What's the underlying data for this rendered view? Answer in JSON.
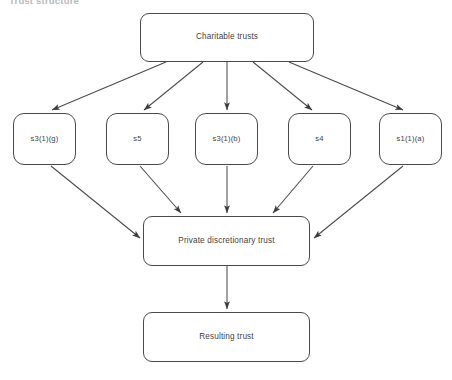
{
  "heading": {
    "text": "Trust structure"
  },
  "diagram": {
    "type": "flowchart",
    "width": 452,
    "height": 380,
    "stroke_color": "#4a4a4a",
    "text_color": "#3f3f3f",
    "background_color": "#ffffff",
    "nodes": [
      {
        "id": "charitable-trusts",
        "label": "Charitable trusts",
        "row": "top",
        "x": 140,
        "y": 13,
        "width": 174,
        "height": 49
      },
      {
        "id": "s3-1-g",
        "label": "s3(1)(g)",
        "row": "middle",
        "x": 13,
        "y": 113,
        "width": 63,
        "height": 52
      },
      {
        "id": "s5",
        "label": "s5",
        "row": "middle",
        "x": 106,
        "y": 113,
        "width": 63,
        "height": 52
      },
      {
        "id": "s3-1-b",
        "label": "s3(1)(b)",
        "row": "middle",
        "x": 195,
        "y": 113,
        "width": 63,
        "height": 52
      },
      {
        "id": "s4",
        "label": "s4",
        "row": "middle",
        "x": 288,
        "y": 113,
        "width": 63,
        "height": 52
      },
      {
        "id": "s1-1-a",
        "label": "s1(1)(a)",
        "row": "middle",
        "x": 379,
        "y": 113,
        "width": 63,
        "height": 52
      },
      {
        "id": "private-discretionary-trust",
        "label": "Private discretionary trust",
        "row": "lower",
        "x": 143,
        "y": 216,
        "width": 167,
        "height": 50
      },
      {
        "id": "resulting-trust",
        "label": "Resulting trust",
        "row": "bottom",
        "x": 143,
        "y": 312,
        "width": 167,
        "height": 50
      }
    ],
    "edges": [
      {
        "from": "charitable-trusts",
        "to": "s3-1-g"
      },
      {
        "from": "charitable-trusts",
        "to": "s5"
      },
      {
        "from": "charitable-trusts",
        "to": "s3-1-b"
      },
      {
        "from": "charitable-trusts",
        "to": "s4"
      },
      {
        "from": "charitable-trusts",
        "to": "s1-1-a"
      },
      {
        "from": "s3-1-g",
        "to": "private-discretionary-trust"
      },
      {
        "from": "s5",
        "to": "private-discretionary-trust"
      },
      {
        "from": "s3-1-b",
        "to": "private-discretionary-trust"
      },
      {
        "from": "s4",
        "to": "private-discretionary-trust"
      },
      {
        "from": "s1-1-a",
        "to": "private-discretionary-trust"
      },
      {
        "from": "private-discretionary-trust",
        "to": "resulting-trust"
      }
    ]
  }
}
